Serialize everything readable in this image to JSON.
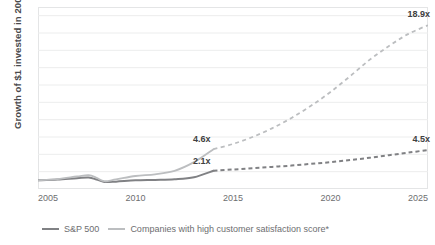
{
  "chart_data": {
    "type": "line",
    "title": "",
    "xlabel": "",
    "ylabel": "Growth of $1 invested  in 2005",
    "xlim": [
      2005,
      2025
    ],
    "ylim": [
      0,
      21
    ],
    "grid": true,
    "gridlines_y": [
      2,
      4,
      6,
      8,
      10,
      12,
      14,
      16,
      18,
      20
    ],
    "xticks": [
      {
        "label": "2005",
        "value": 2005
      },
      {
        "label": "2010",
        "value": 2010
      },
      {
        "label": "2015",
        "value": 2015
      },
      {
        "label": "2020",
        "value": 2020
      },
      {
        "label": "2025",
        "value": 2025
      }
    ],
    "yticks": [],
    "legend_position": "bottom-left",
    "series": [
      {
        "name": "S&P 500",
        "color": "#808184",
        "actual_style": "solid",
        "projection_style": "dashed",
        "split_x": 2014,
        "x": [
          2005,
          2006,
          2007,
          2007.6,
          2008,
          2008.4,
          2009,
          2010,
          2011,
          2012,
          2013,
          2014,
          2015,
          2016,
          2017,
          2018,
          2019,
          2020,
          2021,
          2022,
          2023,
          2024,
          2025
        ],
        "values": [
          1.0,
          1.1,
          1.25,
          1.32,
          1.1,
          0.82,
          0.85,
          1.0,
          1.05,
          1.12,
          1.35,
          2.1,
          2.25,
          2.4,
          2.55,
          2.7,
          2.9,
          3.1,
          3.35,
          3.6,
          3.9,
          4.2,
          4.5
        ]
      },
      {
        "name": "Companies with high customer satisfaction score*",
        "color": "#bcbec0",
        "actual_style": "solid",
        "projection_style": "dashed",
        "split_x": 2014,
        "x": [
          2005,
          2006,
          2007,
          2007.6,
          2008,
          2008.4,
          2009,
          2010,
          2011,
          2012,
          2013,
          2014,
          2015,
          2016,
          2017,
          2018,
          2019,
          2020,
          2021,
          2022,
          2023,
          2024,
          2025
        ],
        "values": [
          1.0,
          1.15,
          1.45,
          1.6,
          1.3,
          0.9,
          1.1,
          1.5,
          1.7,
          2.1,
          3.1,
          4.6,
          5.2,
          6.0,
          7.0,
          8.2,
          9.6,
          11.2,
          13.0,
          14.9,
          16.5,
          17.9,
          18.9
        ]
      }
    ],
    "annotations": [
      {
        "id": "sp500-2014",
        "text": "2.1x",
        "x": 2014,
        "y": 2.1
      },
      {
        "id": "high-csat-2014",
        "text": "4.6x",
        "x": 2014,
        "y": 4.6
      },
      {
        "id": "sp500-2025",
        "text": "4.5x",
        "x": 2025,
        "y": 4.5
      },
      {
        "id": "high-csat-2025",
        "text": "18.9x",
        "x": 2025,
        "y": 18.9
      }
    ]
  },
  "legend": {
    "items": [
      {
        "label": "S&P 500",
        "color": "#808184"
      },
      {
        "label": "Companies with high customer satisfaction score*",
        "color": "#bcbec0"
      }
    ]
  },
  "axis": {
    "y_title": "Growth of $1 invested  in 2005"
  },
  "colors": {
    "sp500": "#808184",
    "high_csat": "#bcbec0",
    "gridline": "#eceded",
    "axis_text": "#6d6e70",
    "label_text": "#404041",
    "background": "#ffffff"
  }
}
